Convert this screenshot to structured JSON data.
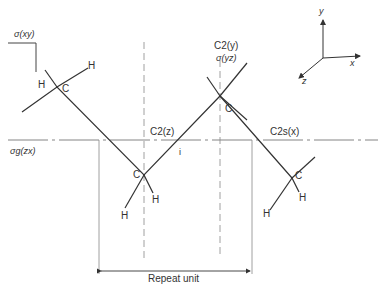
{
  "diagram": {
    "symmetry_labels": {
      "sigma_xy": "σ(xy)",
      "sigma_g_zx": "σg(zx)",
      "c2_z": "C2(z)",
      "c2_y": "C2(y)",
      "sigma_yz": "σ(yz)",
      "c2s_x": "C2s(x)",
      "inversion": "i"
    },
    "atoms": {
      "carbon": "C",
      "hydrogen": "H"
    },
    "axes": {
      "x": "x",
      "y": "y",
      "z": "z"
    },
    "repeat_unit_label": "Repeat unit",
    "colors": {
      "line": "#333333",
      "dashed": "#888888",
      "background": "#ffffff"
    }
  }
}
